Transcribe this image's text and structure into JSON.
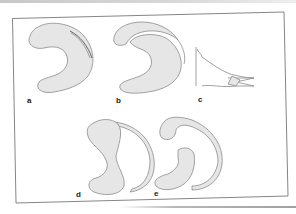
{
  "figure": {
    "labels": {
      "a": "a",
      "b": "b",
      "c": "c",
      "d": "d",
      "e": "e"
    },
    "panels": [
      {
        "id": "a",
        "description": "kidney-shaped body with thin internal slit along the upper-right edge"
      },
      {
        "id": "b",
        "description": "kidney-shaped body with a separated crescent flap along the upper edge"
      },
      {
        "id": "c",
        "description": "profile outline of a tapered tip splitting into two prongs"
      },
      {
        "id": "d",
        "description": "constricted body with a thin outer crescent band on the right"
      },
      {
        "id": "e",
        "description": "rounded head and lower crescent joined by a thin outer arc band"
      }
    ],
    "colors": {
      "fill": "#e6e6e6",
      "stroke": "#8a8a8a",
      "frame": "#777777",
      "label": "#222222"
    }
  }
}
